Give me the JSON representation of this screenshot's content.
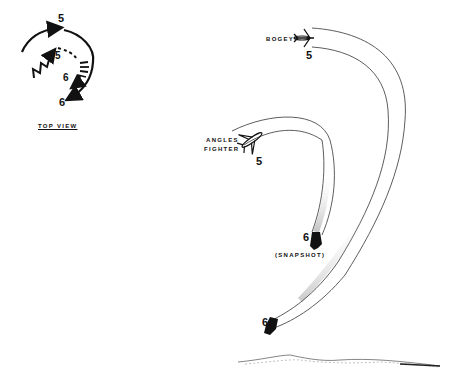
{
  "diagram": {
    "inset": {
      "caption": "TOP VIEW",
      "labels": {
        "outer_top": "5",
        "inner": "5",
        "inner_end": "6",
        "outer_end": "6"
      }
    },
    "bogey": {
      "label": "BOGEY",
      "position_number": "5"
    },
    "angles_fighter": {
      "label_line1": "ANGLES",
      "label_line2": "FIGHTER",
      "position_number": "5"
    },
    "snapshot": {
      "position_number": "6",
      "label": "(SNAPSHOT)"
    },
    "bogey_end": {
      "position_number": "6"
    },
    "colors": {
      "ink": "#111111",
      "trail": "#333333",
      "background": "#ffffff"
    }
  }
}
